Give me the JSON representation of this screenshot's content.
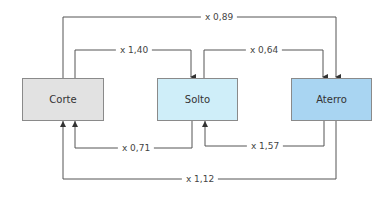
{
  "diagram": {
    "type": "flow",
    "nodes": [
      {
        "id": "corte",
        "label": "Corte",
        "color": "#e2e2e2"
      },
      {
        "id": "solto",
        "label": "Solto",
        "color": "#cfeef9"
      },
      {
        "id": "aterro",
        "label": "Aterro",
        "color": "#a9d5f2"
      }
    ],
    "edges": [
      {
        "from": "corte",
        "to": "aterro",
        "label": "x 0,89"
      },
      {
        "from": "corte",
        "to": "solto",
        "label": "x 1,40"
      },
      {
        "from": "solto",
        "to": "aterro",
        "label": "x 0,64"
      },
      {
        "from": "solto",
        "to": "corte",
        "label": "x 0,71"
      },
      {
        "from": "aterro",
        "to": "solto",
        "label": "x 1,57"
      },
      {
        "from": "aterro",
        "to": "corte",
        "label": "x 1,12"
      }
    ]
  }
}
